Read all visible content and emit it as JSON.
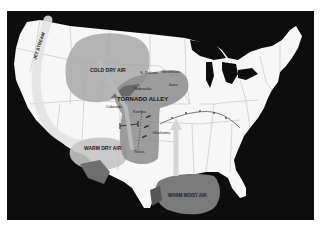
{
  "map": {
    "title": "Tornado Alley",
    "colors": {
      "background": "#ffffff",
      "ocean": "#0d0d0d",
      "land": "#f7f7f7",
      "state_lines": "#bdbdbd",
      "cold_dry_air": "#a8a8a8",
      "warm_dry_air": "#c4c4c4",
      "warm_moist_air": "#7a7a7a",
      "tornado_alley": "#8c8c8c",
      "jet_stream": "#e2e2e2",
      "front": "#555555"
    },
    "air_masses": [
      {
        "id": "cold-dry-air",
        "label": "COLD DRY AIR"
      },
      {
        "id": "warm-dry-air",
        "label": "WARM DRY AIR"
      },
      {
        "id": "warm-moist-air",
        "label": "WARM MOIST AIR"
      }
    ],
    "region_label": "TORNADO ALLEY",
    "jet_stream_label": "JET STREAM",
    "states": [
      {
        "id": "s-dakota",
        "label": "S. Dakota"
      },
      {
        "id": "minnesota",
        "label": "Minnesota"
      },
      {
        "id": "nebraska",
        "label": "Nebraska"
      },
      {
        "id": "iowa",
        "label": "Iowa"
      },
      {
        "id": "colorado",
        "label": "Colorado"
      },
      {
        "id": "kansas",
        "label": "Kansas"
      },
      {
        "id": "oklahoma",
        "label": "Oklahoma"
      },
      {
        "id": "texas",
        "label": "Texas"
      }
    ]
  }
}
